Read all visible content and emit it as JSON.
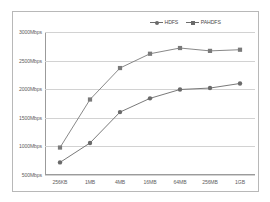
{
  "chart_data": {
    "type": "line",
    "title": "",
    "subtitle": "",
    "xlabel": "",
    "ylabel": "",
    "categories": [
      "256KB",
      "1MB",
      "4MB",
      "16MB",
      "64MB",
      "256MB",
      "1GB"
    ],
    "series": [
      {
        "name": "HDFS",
        "color": "#6a6a6a",
        "marker": "circle",
        "values": [
          720,
          1060,
          1600,
          1840,
          1995,
          2020,
          2100
        ]
      },
      {
        "name": "PAHDFS",
        "color": "#7a7a7a",
        "marker": "square",
        "values": [
          980,
          1820,
          2370,
          2620,
          2720,
          2670,
          2690
        ]
      }
    ],
    "ylim": [
      500,
      3000
    ],
    "ytick_values": [
      3000,
      2500,
      2000,
      1500,
      1000,
      500
    ],
    "ytick_labels": [
      "3000Mbps",
      "2500Mbps",
      "2000Mbps",
      "1500Mbps",
      "1000Mbps",
      "500Mbps"
    ],
    "grid": true,
    "grid_axis": "y",
    "legend_position": "top-right",
    "legend_entries": [
      "HDFS",
      "PAHDFS"
    ],
    "annotations": []
  },
  "colors": {
    "grid": "#d2d2d2",
    "axis": "#9b9b9b",
    "frame": "#b8b8b8",
    "text": "#5e5e5e",
    "series_hdfs": "#6a6a6a",
    "series_pahdfs": "#7a7a7a",
    "background": "#ffffff"
  }
}
